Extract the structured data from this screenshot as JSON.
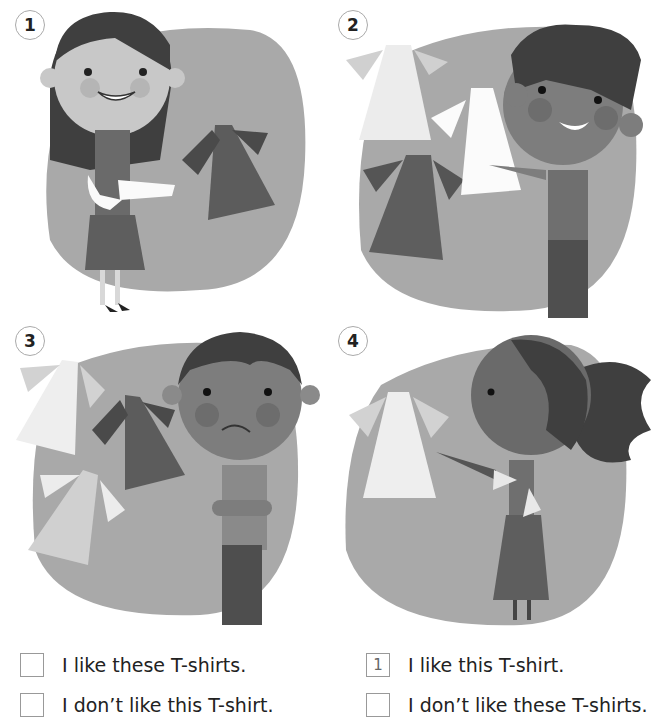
{
  "panels": [
    {
      "number": "1",
      "description": "Smiling girl with long dark hair pointing at herself, a dark T-shirt floating beside her"
    },
    {
      "number": "2",
      "description": "Smiling curly-haired boy pointing at three T-shirts (two light, one dark)"
    },
    {
      "number": "3",
      "description": "Frowning boy with arms crossed beside three T-shirts"
    },
    {
      "number": "4",
      "description": "Girl with ponytail pointing at a single light T-shirt"
    }
  ],
  "answers": [
    {
      "box_value": "",
      "text": "I like these T-shirts."
    },
    {
      "box_value": "1",
      "text": "I like this T-shirt."
    },
    {
      "box_value": "",
      "text": "I don’t like this T-shirt."
    },
    {
      "box_value": "",
      "text": "I don’t like these T-shirts."
    }
  ],
  "colors": {
    "blob": "#a9a9a9",
    "skin": "#c8c8c8",
    "skin_dark": "#7d7d7d",
    "hair": "#3f3f3f",
    "shirt_dark": "#5c5c5c",
    "shirt_light": "#eeeeee"
  }
}
